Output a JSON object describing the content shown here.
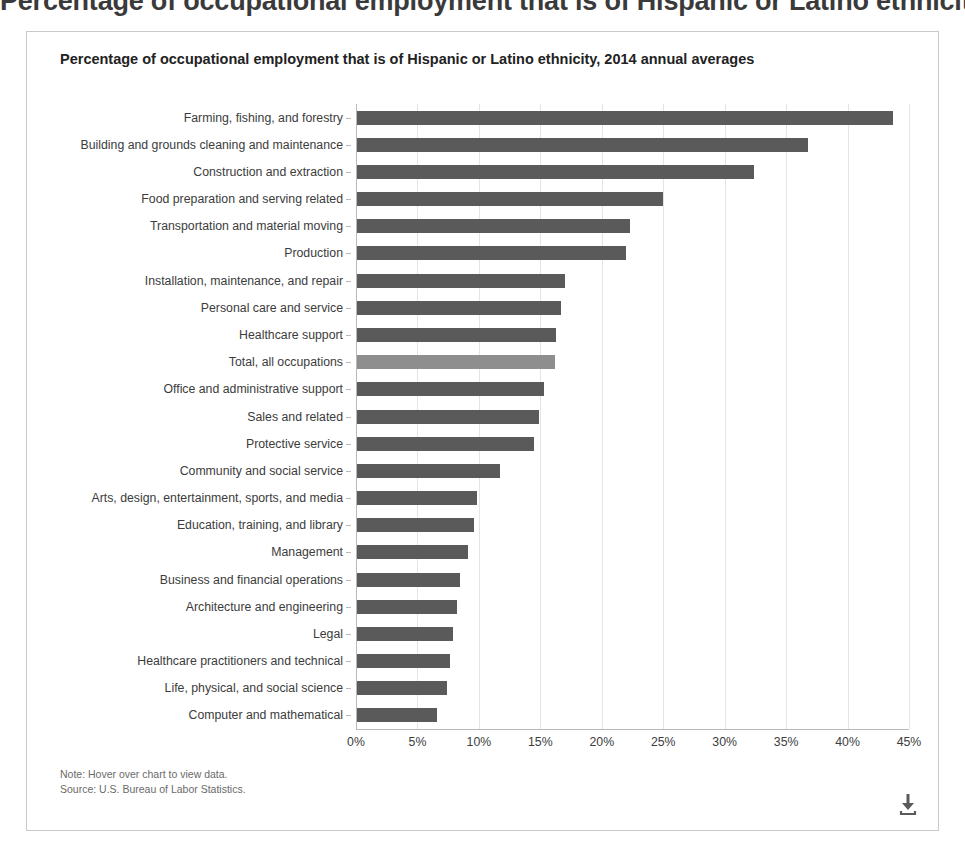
{
  "page": {
    "top_clipped_heading": "Percentage of occupational employment that is of Hispanic or Latino ethnicity,"
  },
  "chart_panel": {
    "note_label": "Note: Hover over chart to view data.",
    "source_label": "Source: U.S. Bureau of Labor Statistics.",
    "download_icon": "download-icon",
    "bar_color": "#5a5a5a",
    "highlight_color": "#8e8e8e",
    "grid_color": "#e4e4e4"
  },
  "chart_data": {
    "type": "bar",
    "orientation": "horizontal",
    "title": "Percentage of occupational employment that is of Hispanic or Latino ethnicity, 2014 annual averages",
    "subtitle": "",
    "xlabel": "",
    "ylabel": "",
    "xlim": [
      0,
      45
    ],
    "xticks": [
      0,
      5,
      10,
      15,
      20,
      25,
      30,
      35,
      40,
      45
    ],
    "xtick_labels": [
      "0%",
      "5%",
      "10%",
      "15%",
      "20%",
      "25%",
      "30%",
      "35%",
      "40%",
      "45%"
    ],
    "grid": true,
    "legend": "none",
    "highlight_category": "Total, all occupations",
    "categories": [
      "Farming, fishing, and forestry",
      "Building and grounds cleaning and maintenance",
      "Construction and extraction",
      "Food preparation and serving related",
      "Transportation and material moving",
      "Production",
      "Installation, maintenance, and repair",
      "Personal care and service",
      "Healthcare support",
      "Total, all occupations",
      "Office and administrative support",
      "Sales and related",
      "Protective service",
      "Community and social service",
      "Arts, design, entertainment, sports, and media",
      "Education, training, and library",
      "Management",
      "Business and financial operations",
      "Architecture and engineering",
      "Legal",
      "Healthcare practitioners and technical",
      "Life, physical, and social science",
      "Computer and mathematical"
    ],
    "values": [
      43.6,
      36.7,
      32.3,
      24.9,
      22.2,
      21.9,
      16.9,
      16.6,
      16.2,
      16.1,
      15.2,
      14.8,
      14.4,
      11.6,
      9.8,
      9.5,
      9.0,
      8.4,
      8.1,
      7.8,
      7.6,
      7.3,
      6.5
    ],
    "value_labels": [
      "43.6%",
      "36.7%",
      "32.3%",
      "24.9%",
      "22.2%",
      "21.9%",
      "16.9%",
      "16.6%",
      "16.2%",
      "16.1%",
      "15.2%",
      "14.8%",
      "14.4%",
      "11.6%",
      "9.8%",
      "9.5%",
      "9.0%",
      "8.4%",
      "8.1%",
      "7.8%",
      "7.6%",
      "7.3%",
      "6.5%"
    ]
  }
}
